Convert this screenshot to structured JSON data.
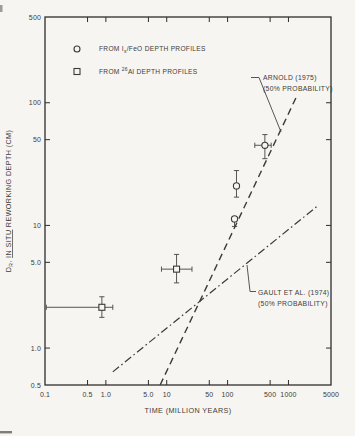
{
  "figure": {
    "background": "#f6f5f1",
    "ink": "#3b3a37",
    "frame_color": "#2e2d2b"
  },
  "chart_data": {
    "type": "scatter",
    "title": "",
    "xlabel": "TIME (MILLION YEARS)",
    "ylabel": "DR, IN SITU REWORKING DEPTH (CM)",
    "ylabel_parts": [
      {
        "t": "D"
      },
      {
        "t": "R",
        "sub": true
      },
      {
        "t": ", "
      },
      {
        "t": "IN SITU",
        "underline": true
      },
      {
        "t": " REWORKING DEPTH (CM)"
      }
    ],
    "x_scale": "log",
    "y_scale": "log",
    "xlim": [
      0.1,
      5000
    ],
    "ylim": [
      0.5,
      500
    ],
    "x_ticks": [
      0.1,
      0.5,
      1.0,
      5.0,
      10,
      50,
      100,
      500,
      1000,
      5000
    ],
    "x_tick_labels": [
      "0.1",
      "0.5",
      "1.0",
      "5.0",
      "10",
      "50",
      "100",
      "500",
      "1000",
      "5000"
    ],
    "y_ticks": [
      500,
      100,
      50,
      10,
      5.0,
      1.0,
      0.5
    ],
    "y_tick_labels": [
      "500",
      "100",
      "50",
      "10",
      "5.0",
      "1.0",
      "0.5"
    ],
    "grid": false,
    "legend_position": "top-left-inside",
    "legend": [
      {
        "key": "isfeo",
        "symbol": "circle",
        "label": "FROM Is/FeO DEPTH PROFILES",
        "label_parts": [
          {
            "t": "FROM I"
          },
          {
            "t": "s",
            "sub": true
          },
          {
            "t": "/FeO DEPTH PROFILES"
          }
        ]
      },
      {
        "key": "al26",
        "symbol": "square",
        "label": "FROM 26Al DEPTH PROFILES",
        "label_parts": [
          {
            "t": "FROM "
          },
          {
            "t": "26",
            "sup": true
          },
          {
            "t": "Al DEPTH PROFILES"
          }
        ]
      }
    ],
    "series": [
      {
        "key": "isfeo",
        "name": "From Is/FeO depth profiles",
        "symbol": "circle",
        "points": [
          {
            "x": 140,
            "y": 21,
            "y_err": [
              17,
              28
            ]
          },
          {
            "x": 130,
            "y": 11.3,
            "y_err": [
              9.8,
              11.8
            ]
          },
          {
            "x": 410,
            "y": 45,
            "x_err": [
              280,
              520
            ],
            "y_err": [
              35,
              55
            ]
          }
        ]
      },
      {
        "key": "al26",
        "name": "From 26Al depth profiles",
        "symbol": "square",
        "points": [
          {
            "x": 0.86,
            "y": 2.15,
            "x_err": [
              0.105,
              1.3
            ],
            "y_err": [
              1.78,
              2.62
            ]
          },
          {
            "x": 14.5,
            "y": 4.4,
            "x_err": [
              8.2,
              26
            ],
            "y_err": [
              3.4,
              5.8
            ]
          }
        ]
      }
    ],
    "lines": [
      {
        "key": "arnold-line",
        "name": "ARNOLD (1975) (50% PROBABILITY)",
        "style": "dashed",
        "from": {
          "x": 7.8,
          "y": 0.5
        },
        "to": {
          "x": 1400,
          "y": 116
        }
      },
      {
        "key": "gault-line",
        "name": "GAULT ET AL. (1974) (50% PROBABILITY)",
        "style": "dashdot",
        "from": {
          "x": 1.3,
          "y": 0.64
        },
        "to": {
          "x": 3000,
          "y": 14.4
        }
      }
    ],
    "annotations": [
      {
        "key": "arnold-label",
        "lines": [
          "ARNOLD (1975)",
          "(50% PROBABILITY)"
        ],
        "x": 263,
        "y": 80,
        "leader": [
          [
            251,
            77.5
          ],
          [
            259,
            77.5
          ],
          [
            281,
            132
          ]
        ]
      },
      {
        "key": "gault-label",
        "lines": [
          "GAULT ET AL. (1974)",
          "(50% PROBABILITY)"
        ],
        "x": 258,
        "y": 295,
        "leader": [
          [
            256,
            291.5
          ],
          [
            250,
            291.5
          ],
          [
            247,
            265
          ]
        ]
      }
    ],
    "plot_area_px": {
      "left": 45,
      "right": 331,
      "top": 17,
      "bottom": 385
    }
  }
}
